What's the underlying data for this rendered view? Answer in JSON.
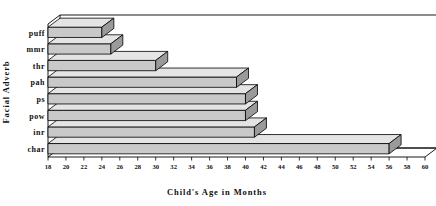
{
  "chart_data": {
    "type": "bar",
    "orientation": "horizontal",
    "title": "",
    "xlabel": "Child's Age in Months",
    "ylabel": "Facial Adverb",
    "categories": [
      "char",
      "inr",
      "pow",
      "ps",
      "pah",
      "thr",
      "mmr",
      "puff"
    ],
    "values": [
      56,
      41,
      40,
      40,
      39,
      30,
      25,
      24
    ],
    "xlim": [
      18,
      60
    ],
    "xticks": [
      18,
      20,
      22,
      24,
      26,
      28,
      30,
      32,
      34,
      36,
      38,
      40,
      42,
      44,
      46,
      48,
      50,
      52,
      54,
      56,
      58,
      60
    ],
    "xtick_labels": [
      "18",
      "20",
      "22",
      "24",
      "26",
      "28",
      "30",
      "32",
      "34",
      "36",
      "38",
      "40",
      "42",
      "44",
      "46",
      "48",
      "50",
      "52",
      "54",
      "56",
      "58",
      "60"
    ],
    "grid": false,
    "legend": null,
    "style": "3d-bar",
    "bar_fill_color": "#c9c9c9",
    "bar_top_color": "#e4e4e4",
    "bar_side_color": "#9a9a9a",
    "axis_color": "#000000",
    "background_color": "#ffffff"
  }
}
